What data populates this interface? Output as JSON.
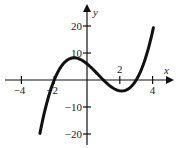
{
  "chart_data": {
    "type": "line",
    "title": "",
    "xlabel": "x",
    "ylabel": "y",
    "function": "x^3 - 2x^2 - 5x + 6",
    "xlim": [
      -4.8,
      5.3
    ],
    "ylim": [
      -24,
      29
    ],
    "x_ticks": [
      -4,
      -2,
      2,
      4
    ],
    "x_tick_labels": [
      "-4",
      "-2",
      "2",
      "4"
    ],
    "y_ticks": [
      20,
      10,
      -10,
      -20
    ],
    "y_tick_labels": [
      "20",
      "10",
      "-10",
      "-20"
    ],
    "grid": false,
    "legend": null,
    "series": [
      {
        "name": "f(x)",
        "x": [
          -2.87,
          -2.5,
          -2,
          -1.5,
          -1,
          -0.79,
          -0.5,
          0,
          0.5,
          1,
          1.5,
          2,
          2.12,
          2.5,
          3,
          3.5,
          4,
          4.05
        ],
        "y": [
          -19.8,
          -11.4,
          0,
          5.6,
          8,
          8.2,
          7.9,
          6,
          3.1,
          0,
          -2.6,
          -4,
          -4.06,
          -3.4,
          0,
          6.9,
          18,
          19.4
        ]
      }
    ],
    "x_intercepts": [
      -2,
      1,
      3
    ],
    "y_intercept": 6,
    "local_max": [
      -0.79,
      8.2
    ],
    "local_min": [
      2.12,
      -4.06
    ]
  }
}
